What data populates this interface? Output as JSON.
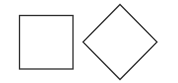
{
  "canvas": {
    "width": 178,
    "height": 83,
    "background": "#ffffff"
  },
  "shapes": [
    {
      "type": "square",
      "x": 19.5,
      "y": 15.5,
      "width": 53.5,
      "height": 53.5,
      "stroke": "#2b2b2b",
      "stroke_width": 1.3,
      "fill": "none"
    },
    {
      "type": "diamond",
      "points": [
        [
          120,
          4.5
        ],
        [
          157,
          42
        ],
        [
          120,
          79.5
        ],
        [
          83,
          42
        ]
      ],
      "stroke": "#2b2b2b",
      "stroke_width": 1.3,
      "fill": "none"
    }
  ]
}
